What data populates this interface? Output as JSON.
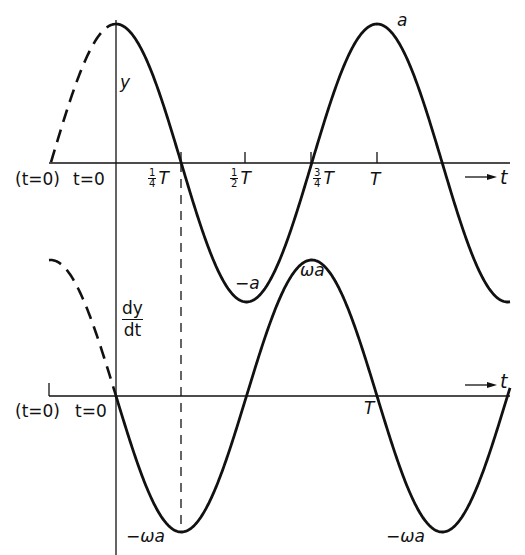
{
  "figure": {
    "top_graph": {
      "y_axis_label": "y",
      "t0_label_alt": "(t=0)",
      "t0_label": "t=0",
      "ticks": [
        {
          "num": "1",
          "den": "4",
          "sym": "T"
        },
        {
          "num": "1",
          "den": "2",
          "sym": "T"
        },
        {
          "num": "3",
          "den": "4",
          "sym": "T"
        },
        {
          "num": "",
          "den": "",
          "sym": "T"
        }
      ],
      "t_axis_label": "t",
      "max_label": "a",
      "min_label": "−a"
    },
    "bottom_graph": {
      "y_axis_num": "dy",
      "y_axis_den": "dt",
      "t0_label_alt": "(t=0)",
      "t0_label": "t=0",
      "period_label": "T",
      "t_axis_label": "t",
      "max_label": "ωa",
      "min_label_left": "−ωa",
      "min_label_right": "−ωa"
    }
  },
  "chart_data": {
    "type": "line",
    "title": "",
    "series": [
      {
        "name": "y = a cos(ωt)",
        "x": [
          "-1/4 T (dashed)",
          "0",
          "1/4 T",
          "1/2 T",
          "3/4 T",
          "T",
          "5/4 T"
        ],
        "values": [
          "0",
          "a",
          "0",
          "-a",
          "0",
          "a",
          "0"
        ]
      },
      {
        "name": "dy/dt = -ωa sin(ωt)",
        "x": [
          "-1/4 T (dashed)",
          "0",
          "1/4 T",
          "1/2 T",
          "3/4 T",
          "T",
          "5/4 T"
        ],
        "values": [
          "ωa",
          "0",
          "-ωa",
          "0",
          "ωa",
          "0",
          "-ωa"
        ]
      }
    ],
    "xlabel": "t",
    "ylabel_top": "y",
    "ylabel_bottom": "dy/dt"
  }
}
